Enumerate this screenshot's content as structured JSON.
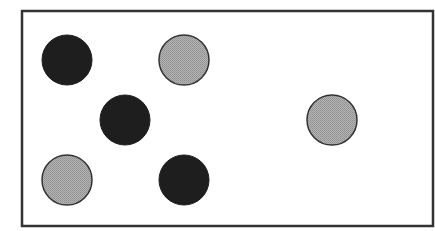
{
  "diagram": {
    "type": "dot-pattern",
    "frame": {
      "x": 22,
      "y": 11,
      "width": 411,
      "height": 215,
      "stroke": "#333333",
      "stroke_width": 2.5
    },
    "colors": {
      "dark_fill": "#1e1e1e",
      "gray_fill": "#ababab",
      "outline": "#333333",
      "background": "#ffffff"
    },
    "radius": 25,
    "dots": [
      {
        "id": 1,
        "kind": "dark",
        "cx": 67,
        "cy": 60
      },
      {
        "id": 2,
        "kind": "gray",
        "cx": 184,
        "cy": 60
      },
      {
        "id": 3,
        "kind": "dark",
        "cx": 125,
        "cy": 120
      },
      {
        "id": 4,
        "kind": "gray",
        "cx": 332,
        "cy": 120
      },
      {
        "id": 5,
        "kind": "gray",
        "cx": 67,
        "cy": 180
      },
      {
        "id": 6,
        "kind": "dark",
        "cx": 184,
        "cy": 180
      }
    ],
    "counts": {
      "dark": 3,
      "gray": 3,
      "total": 6
    }
  }
}
